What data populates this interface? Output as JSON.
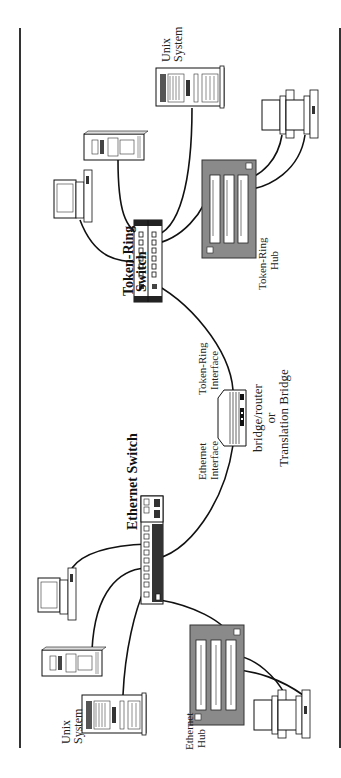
{
  "diagram": {
    "orientation": "rotated-90-ccw",
    "colors": {
      "line": "#111111",
      "device_fill": "#ffffff",
      "hub_fill": "#8a8a8a",
      "switch_dark": "#333333",
      "frame": "#333333"
    },
    "labels": {
      "ethernet_switch": "Ethernet Switch",
      "token_ring_switch_line1": "Token-Ring",
      "token_ring_switch_line2": "Switch",
      "bridge_line1": "bridge/router",
      "bridge_line2": "or",
      "bridge_line3": "Translation Bridge",
      "ethernet_interface_line1": "Ethernet",
      "ethernet_interface_line2": "Interface",
      "token_ring_interface_line1": "Token-Ring",
      "token_ring_interface_line2": "Interface",
      "unix_system_top_line1": "Unix",
      "unix_system_top_line2": "System",
      "unix_system_bottom_line1": "Unix",
      "unix_system_bottom_line2": "System",
      "token_ring_hub_line1": "Token-Ring",
      "token_ring_hub_line2": "Hub",
      "ethernet_hub_line1": "Ethernet",
      "ethernet_hub_line2": "Hub"
    }
  }
}
